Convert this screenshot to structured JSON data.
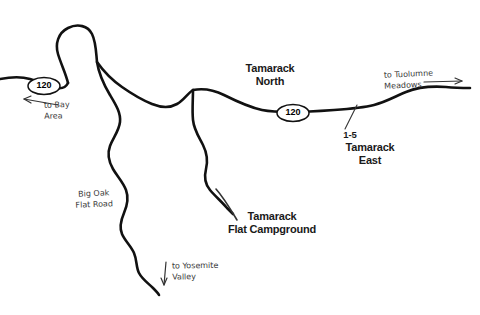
{
  "map": {
    "background_color": "#ffffff",
    "road_color": "#111111",
    "label_color": "#1a1a1a",
    "hand_label_color": "#3a3a3a"
  },
  "route_shields": [
    {
      "name": "route-shield-west",
      "number": "120"
    },
    {
      "name": "route-shield-east",
      "number": "120"
    }
  ],
  "place_labels": [
    {
      "name": "tamarack-north",
      "text": "Tamarack\nNorth"
    },
    {
      "name": "tamarack-east",
      "text": "Tamarack\nEast"
    },
    {
      "name": "tamarack-flat-campground",
      "text": "Tamarack\nFlat Campground"
    }
  ],
  "site_numbers": [
    {
      "name": "site-range-1-5",
      "text": "1-5"
    }
  ],
  "direction_labels": [
    {
      "name": "to-bay-area",
      "text": "to Bay\nArea"
    },
    {
      "name": "to-tuolumne-meadows",
      "text": "to Tuolumne\nMeadows"
    },
    {
      "name": "to-yosemite-valley",
      "text": "to Yosemite\nValley"
    }
  ],
  "road_labels": [
    {
      "name": "big-oak-flat-road",
      "text": "Big Oak\nFlat Road"
    }
  ]
}
